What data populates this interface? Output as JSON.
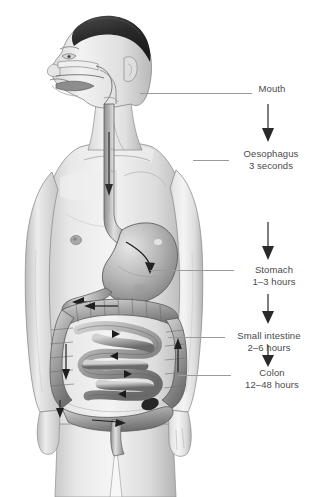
{
  "diagram": {
    "style": "grayscale pencil / airbrush medical illustration",
    "background_color": "#ffffff",
    "text_color": "#4a4a4a",
    "leader_color": "#9a9a9a",
    "arrow_color": "#3a3a3a"
  },
  "labels": [
    {
      "id": "mouth",
      "name": "Mouth",
      "time": ""
    },
    {
      "id": "oesophagus",
      "name": "Oesophagus",
      "time": "3 seconds"
    },
    {
      "id": "stomach",
      "name": "Stomach",
      "time": "1–3 hours"
    },
    {
      "id": "small_intestine",
      "name": "Small intestine",
      "time": "2–6 hours"
    },
    {
      "id": "colon",
      "name": "Colon",
      "time": "12–48 hours"
    }
  ],
  "organs": [
    "oral cavity",
    "pharynx",
    "oesophagus",
    "stomach",
    "duodenum",
    "small intestine",
    "ascending colon",
    "transverse colon",
    "descending colon",
    "sigmoid colon",
    "rectum"
  ],
  "flow_arrows": 4
}
